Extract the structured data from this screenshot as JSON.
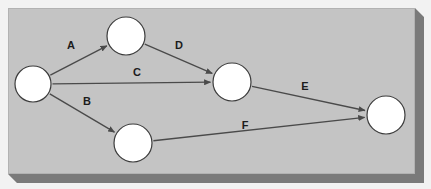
{
  "panel": {
    "name": "beveled-gray-panel",
    "face_color": "#c4c4c4",
    "shadow_color": "#7a7a7a",
    "outer_background": "#f2f2f2",
    "border_color": "#b2b2b2",
    "x": 8,
    "y": 8,
    "width": 407,
    "height": 166,
    "bevel_depth": 9
  },
  "diagram": {
    "type": "directed-graph",
    "title": "",
    "node_fill": "#ffffff",
    "node_stroke": "#3c3c3c",
    "node_radius": 18,
    "edge_color": "#4a4a4a",
    "edge_width": 1.3,
    "label_color": "#1c1c1c",
    "nodes": [
      {
        "id": "n1",
        "label": "",
        "cx": 33,
        "cy": 84,
        "r": 18
      },
      {
        "id": "n2",
        "label": "",
        "cx": 126,
        "cy": 36,
        "r": 19
      },
      {
        "id": "n3",
        "label": "",
        "cx": 133,
        "cy": 143,
        "r": 19
      },
      {
        "id": "n4",
        "label": "",
        "cx": 232,
        "cy": 82,
        "r": 19
      },
      {
        "id": "n5",
        "label": "",
        "cx": 386,
        "cy": 115,
        "r": 19
      }
    ],
    "edges": [
      {
        "id": "e-a",
        "label": "A",
        "from": "n1",
        "to": "n2",
        "label_x": 71,
        "label_y": 46
      },
      {
        "id": "e-b",
        "label": "B",
        "from": "n1",
        "to": "n3",
        "label_x": 87,
        "label_y": 102
      },
      {
        "id": "e-c",
        "label": "C",
        "from": "n1",
        "to": "n4",
        "label_x": 137,
        "label_y": 73
      },
      {
        "id": "e-d",
        "label": "D",
        "from": "n2",
        "to": "n4",
        "label_x": 179,
        "label_y": 46
      },
      {
        "id": "e-e",
        "label": "E",
        "from": "n4",
        "to": "n5",
        "label_x": 305,
        "label_y": 87
      },
      {
        "id": "e-f",
        "label": "F",
        "from": "n3",
        "to": "n5",
        "label_x": 245,
        "label_y": 126
      }
    ]
  }
}
